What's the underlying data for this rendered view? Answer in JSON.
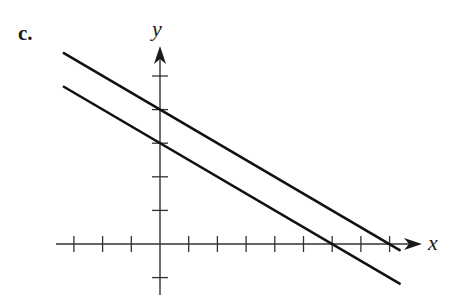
{
  "figure": {
    "part_label": "c.",
    "x_axis_label": "x",
    "y_axis_label": "y"
  },
  "chart_data": {
    "type": "line",
    "title": "",
    "xlabel": "x",
    "ylabel": "y",
    "xlim": [
      -3.2,
      9.2
    ],
    "ylim": [
      -1.5,
      5.8
    ],
    "grid": false,
    "legend": null,
    "x_ticks": [
      -3,
      -2,
      -1,
      1,
      2,
      3,
      4,
      5,
      6,
      7,
      8
    ],
    "y_ticks": [
      -1,
      1,
      2,
      3,
      4,
      5
    ],
    "series": [
      {
        "name": "upper line",
        "equation": "y = -x/2 + 4",
        "slope": -0.5,
        "y_intercept": 4,
        "x_intercept": 8,
        "x": [
          -3.35,
          8.35
        ],
        "y": [
          5.68,
          -0.18
        ]
      },
      {
        "name": "lower line",
        "equation": "y = -x/2 + 3",
        "slope": -0.5,
        "y_intercept": 3,
        "x_intercept": 6,
        "x": [
          -3.35,
          8.35
        ],
        "y": [
          4.68,
          -1.18
        ]
      }
    ],
    "annotations": [
      "parallel lines"
    ]
  },
  "colors": {
    "ink": "#1a1a1a",
    "background": "#ffffff"
  }
}
